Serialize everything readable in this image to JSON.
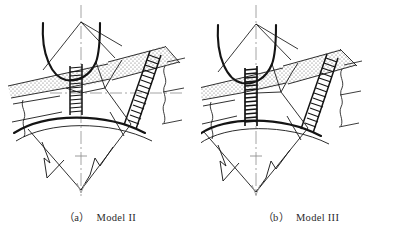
{
  "figure": {
    "background_color": "#ffffff",
    "line_color": "#1a1a1a",
    "stipple_color": "#7a7a7a",
    "centerline_color": "#9a9a9a",
    "caption_color": "#2b2b2b",
    "width": 401,
    "height": 232
  },
  "panels": [
    {
      "id": "panel-a",
      "caption_tag": "（a）",
      "caption_label": "Model II",
      "caption_full": "（a） Model II",
      "diagram_name": "tunnel-crown-rock-mass-model-2",
      "features": {
        "tunnel_arch": "horseshoe-arch-opening",
        "roof_wedge": "peaked-roof-wedge",
        "strata_band": "stippled-rock-layer",
        "vertical_joint": "vertical-hatched-fault-band",
        "inclined_joint": "inclined-hatched-fault-band",
        "failure_wedge": "v-shaped-failure-wedge",
        "crack_lines": "zigzag-crack-lines",
        "vertical_centerline": "dash-dot-vertical-axis",
        "horizontal_centerline": "dash-dot-horizontal-axis",
        "break_lines": "wavy-break-lines"
      }
    },
    {
      "id": "panel-b",
      "caption_tag": "（b）",
      "caption_label": "Model III",
      "caption_full": "（b） Model III",
      "diagram_name": "tunnel-crown-rock-mass-model-3",
      "features": {
        "tunnel_arch": "horseshoe-arch-opening",
        "roof_wedge": "peaked-roof-wedge",
        "strata_band": "stippled-rock-layer",
        "vertical_joint": "vertical-hatched-fault-band-extended",
        "inclined_joint": "inclined-hatched-fault-band",
        "failure_wedge": "v-shaped-failure-wedge",
        "crack_lines": "zigzag-crack-lines",
        "vertical_centerline": "dash-dot-vertical-axis",
        "horizontal_centerline": "none",
        "break_lines": "wavy-break-lines"
      }
    }
  ]
}
